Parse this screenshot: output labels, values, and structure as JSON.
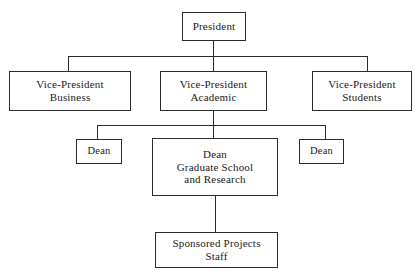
{
  "chart_data": {
    "type": "diagram",
    "diagram_kind": "organizational-chart",
    "title": "",
    "background_color": "#ffffff",
    "line_color": "#2b2b2b",
    "text_color": "#1a1a1a",
    "nodes": [
      {
        "id": "president",
        "lines": [
          "President"
        ]
      },
      {
        "id": "vp_business",
        "lines": [
          "Vice-President",
          "Business"
        ]
      },
      {
        "id": "vp_academic",
        "lines": [
          "Vice-President",
          "Academic"
        ]
      },
      {
        "id": "vp_students",
        "lines": [
          "Vice-President",
          "Students"
        ]
      },
      {
        "id": "dean_left",
        "lines": [
          "Dean"
        ]
      },
      {
        "id": "grad_school",
        "lines": [
          "Dean",
          "Graduate School",
          "and Research"
        ]
      },
      {
        "id": "dean_right",
        "lines": [
          "Dean"
        ]
      },
      {
        "id": "sponsored",
        "lines": [
          "Sponsored Projects",
          "Staff"
        ]
      }
    ],
    "edges": [
      {
        "from": "president",
        "to": "vp_business"
      },
      {
        "from": "president",
        "to": "vp_academic"
      },
      {
        "from": "president",
        "to": "vp_students"
      },
      {
        "from": "vp_academic",
        "to": "dean_left"
      },
      {
        "from": "vp_academic",
        "to": "grad_school"
      },
      {
        "from": "vp_academic",
        "to": "dean_right"
      },
      {
        "from": "grad_school",
        "to": "sponsored"
      }
    ]
  },
  "nodes": {
    "president": {
      "line1": "President"
    },
    "vp_business": {
      "line1": "Vice-President",
      "line2": "Business"
    },
    "vp_academic": {
      "line1": "Vice-President",
      "line2": "Academic"
    },
    "vp_students": {
      "line1": "Vice-President",
      "line2": "Students"
    },
    "dean_left": {
      "line1": "Dean"
    },
    "dean_right": {
      "line1": "Dean"
    },
    "grad_school": {
      "line1": "Dean",
      "line2": "Graduate School",
      "line3": "and Research"
    },
    "sponsored": {
      "line1": "Sponsored Projects",
      "line2": "Staff"
    }
  }
}
